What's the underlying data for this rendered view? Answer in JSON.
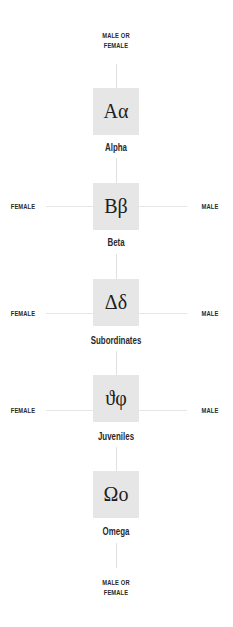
{
  "top_label": {
    "line1": "MALE OR",
    "line2": "FEMALE"
  },
  "bottom_label": {
    "line1": "MALE OR",
    "line2": "FEMALE"
  },
  "ranks": [
    {
      "symbol": "Aα",
      "name": "Alpha",
      "left": "",
      "right": ""
    },
    {
      "symbol": "Bβ",
      "name": "Beta",
      "left": "FEMALE",
      "right": "MALE"
    },
    {
      "symbol": "Δδ",
      "name": "Subordinates",
      "left": "FEMALE",
      "right": "MALE"
    },
    {
      "symbol": "ϑφ",
      "name": "Juveniles",
      "left": "FEMALE",
      "right": "MALE"
    },
    {
      "symbol": "Ωο",
      "name": "Omega",
      "left": "",
      "right": ""
    }
  ],
  "colors": {
    "box_fill": "#e6e6e6",
    "line": "#e0e0e0",
    "text": "#222222"
  }
}
